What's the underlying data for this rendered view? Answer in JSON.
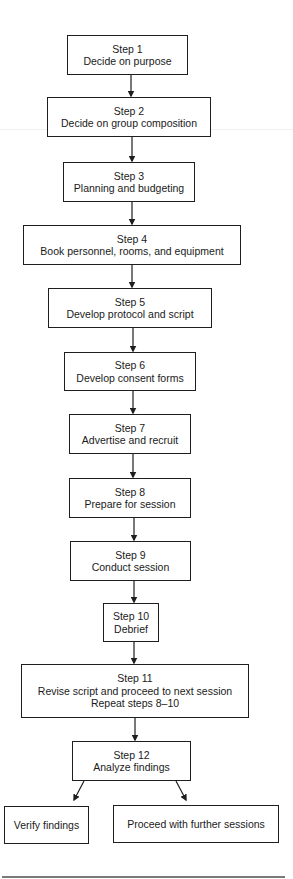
{
  "diagram": {
    "type": "flowchart",
    "steps": [
      {
        "id": "step-1",
        "label": "Step 1",
        "text": "Decide on purpose"
      },
      {
        "id": "step-2",
        "label": "Step 2",
        "text": "Decide on group composition"
      },
      {
        "id": "step-3",
        "label": "Step 3",
        "text": "Planning and budgeting"
      },
      {
        "id": "step-4",
        "label": "Step 4",
        "text": "Book personnel, rooms, and equipment"
      },
      {
        "id": "step-5",
        "label": "Step 5",
        "text": "Develop protocol and script"
      },
      {
        "id": "step-6",
        "label": "Step 6",
        "text": "Develop consent forms"
      },
      {
        "id": "step-7",
        "label": "Step 7",
        "text": "Advertise and recruit"
      },
      {
        "id": "step-8",
        "label": "Step 8",
        "text": "Prepare for session"
      },
      {
        "id": "step-9",
        "label": "Step 9",
        "text": "Conduct session"
      },
      {
        "id": "step-10",
        "label": "Step 10",
        "text": "Debrief"
      },
      {
        "id": "step-11",
        "label": "Step 11",
        "text": "Revise script and proceed to next session",
        "text2": "Repeat steps 8–10"
      },
      {
        "id": "step-12",
        "label": "Step 12",
        "text": "Analyze findings"
      }
    ],
    "outcomes": [
      {
        "id": "verify",
        "text": "Verify findings"
      },
      {
        "id": "proceed",
        "text": "Proceed with further sessions"
      }
    ],
    "colors": {
      "stroke": "#1e1e1e",
      "background": "#ffffff",
      "rule": "#7a7a7a"
    }
  }
}
